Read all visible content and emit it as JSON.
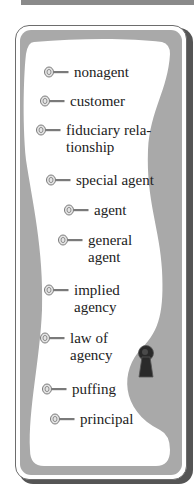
{
  "panel": {
    "colors": {
      "frame": "#a9a9a9",
      "content": "#ffffff",
      "shadow": "#555555",
      "text": "#222222",
      "keyhole": "#2a2a2a"
    },
    "terms": [
      {
        "label": "nonagent",
        "icon": "key-icon"
      },
      {
        "label": "customer",
        "icon": "key-icon"
      },
      {
        "label": "fiduciary rela-\ntionship",
        "icon": "key-icon"
      },
      {
        "label": "special agent",
        "icon": "key-icon"
      },
      {
        "label": "agent",
        "icon": "key-icon"
      },
      {
        "label": "general\nagent",
        "icon": "key-icon"
      },
      {
        "label": "implied\nagency",
        "icon": "key-icon"
      },
      {
        "label": "law of\nagency",
        "icon": "key-icon"
      },
      {
        "label": "puffing",
        "icon": "key-icon"
      },
      {
        "label": "principal",
        "icon": "key-icon"
      }
    ],
    "decoration": "keyhole-icon"
  }
}
